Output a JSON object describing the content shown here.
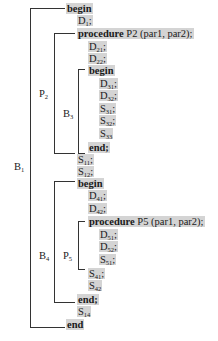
{
  "labels": {
    "B1": {
      "name": "B",
      "sub": "1"
    },
    "P2": {
      "name": "P",
      "sub": "2"
    },
    "B3": {
      "name": "B",
      "sub": "3"
    },
    "B4": {
      "name": "B",
      "sub": "4"
    },
    "P5": {
      "name": "P",
      "sub": "5"
    }
  },
  "lines": {
    "begin1": "begin",
    "D1": {
      "name": "D",
      "sub": "1",
      "sep": ";"
    },
    "proc2_kw": "procedure",
    "proc2_rest": " P2 (par1, par2);",
    "D21": {
      "name": "D",
      "sub": "21",
      "sep": ";"
    },
    "D22": {
      "name": "D",
      "sub": "22",
      "sep": ";"
    },
    "begin3": "begin",
    "D31": {
      "name": "D",
      "sub": "31",
      "sep": ";"
    },
    "D32": {
      "name": "D",
      "sub": "32",
      "sep": ";"
    },
    "S31": {
      "name": "S",
      "sub": "31",
      "sep": ";"
    },
    "S32": {
      "name": "S",
      "sub": "32",
      "sep": ";"
    },
    "S33": {
      "name": "S",
      "sub": "33",
      "sep": ""
    },
    "end3": "end;",
    "S11": {
      "name": "S",
      "sub": "11",
      "sep": ";"
    },
    "S12": {
      "name": "S",
      "sub": "12",
      "sep": ";"
    },
    "begin4": "begin",
    "D41": {
      "name": "D",
      "sub": "41",
      "sep": ";"
    },
    "D42": {
      "name": "D",
      "sub": "42",
      "sep": ";"
    },
    "proc5_kw": "procedure",
    "proc5_rest": " P5 (par1, par2);",
    "D51": {
      "name": "D",
      "sub": "51",
      "sep": ";"
    },
    "D52": {
      "name": "D",
      "sub": "52",
      "sep": ";"
    },
    "S51": {
      "name": "S",
      "sub": "51",
      "sep": ";"
    },
    "S41": {
      "name": "S",
      "sub": "41",
      "sep": ";"
    },
    "S42": {
      "name": "S",
      "sub": "42",
      "sep": ""
    },
    "end4": "end;",
    "S14": {
      "name": "S",
      "sub": "14",
      "sep": ""
    },
    "end1": "end"
  },
  "colors": {
    "highlight": "#d4d4d4",
    "line": "#333333"
  }
}
